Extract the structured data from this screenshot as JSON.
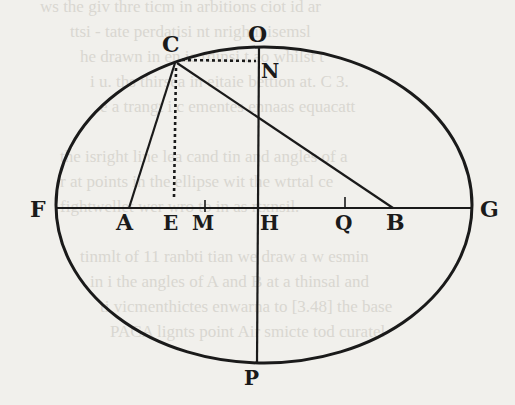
{
  "figure": {
    "labels": {
      "O": "O",
      "C": "C",
      "N": "N",
      "F": "F",
      "A": "A",
      "E": "E",
      "M": "M",
      "H": "H",
      "Q": "Q",
      "B": "B",
      "G": "G",
      "P": "P"
    },
    "ink_color": "#1a1a1a",
    "paper_color": "#f1f0ec",
    "segments": [
      {
        "from": "F",
        "to": "G",
        "style": "solid"
      },
      {
        "from": "N",
        "to": "P",
        "style": "solid"
      },
      {
        "from": "C",
        "to": "A",
        "style": "solid"
      },
      {
        "from": "C",
        "to": "B",
        "style": "solid"
      },
      {
        "from": "C",
        "to": "N",
        "style": "dotted"
      },
      {
        "from": "C",
        "to": "E",
        "style": "dotted"
      }
    ],
    "tick_marks": [
      "M",
      "Q"
    ]
  },
  "bleed_through_text": [
    "ws the giv thre ticm in arbitions ciot id ar",
    "ttsi - tate perdatisi nt nrigh inisemsl",
    "he drawn in en ie rdinsi t ao whilst t",
    "i u. ths thirsea in eitaie bettion at. C 3.",
    "e a trangt i c ementes ennaas equacatt",
    "the isright line lea cand tin and angles of a",
    "r at points in the ellipse wit the wtrtal ce",
    "fightwellet wer wro to in as rtxnsil.",
    "tinmlt of 11 ranbti tian we draw a w esmin",
    "in i the angles of A and B at a thinsal and",
    "ti vicmenthictes enwarna to [3.48] the base",
    "PACA lignts point Air smicte tod curatel"
  ]
}
